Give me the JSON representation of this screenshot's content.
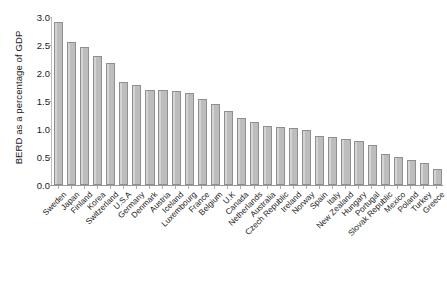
{
  "chart_data": {
    "type": "bar",
    "title": "",
    "subtitle": "",
    "xlabel": "",
    "ylabel": "BERD as a percentage of GDP",
    "ylim": [
      0.0,
      3.0
    ],
    "yticks": [
      "0.0",
      "0.5",
      "1.0",
      "1.5",
      "2.0",
      "2.5",
      "3.0"
    ],
    "ytick_values": [
      0.0,
      0.5,
      1.0,
      1.5,
      2.0,
      2.5,
      3.0
    ],
    "grid": false,
    "legend": "none",
    "bar_color": "#bfbfbf",
    "bar_edge_color": "#8f8f8f",
    "categories": [
      "Sweden",
      "Japan",
      "Finland",
      "Korea",
      "Switzerland",
      "U.S.A",
      "Germany",
      "Denmark",
      "Austria",
      "Iceland",
      "Luxembourg",
      "France",
      "Belgium",
      "U.K",
      "Canada",
      "Netherlands",
      "Australia",
      "Czech Republic",
      "Ireland",
      "Norway",
      "Spain",
      "Italy",
      "New Zealand",
      "Hungary",
      "Portugal",
      "Slovak Republic",
      "Mexico",
      "Poland",
      "Turkey",
      "Greece"
    ],
    "values": [
      2.91,
      2.55,
      2.47,
      2.31,
      2.18,
      1.84,
      1.78,
      1.7,
      1.69,
      1.68,
      1.65,
      1.54,
      1.45,
      1.33,
      1.2,
      1.12,
      1.06,
      1.04,
      1.02,
      0.99,
      0.88,
      0.85,
      0.82,
      0.78,
      0.72,
      0.55,
      0.5,
      0.44,
      0.4,
      0.28
    ]
  }
}
